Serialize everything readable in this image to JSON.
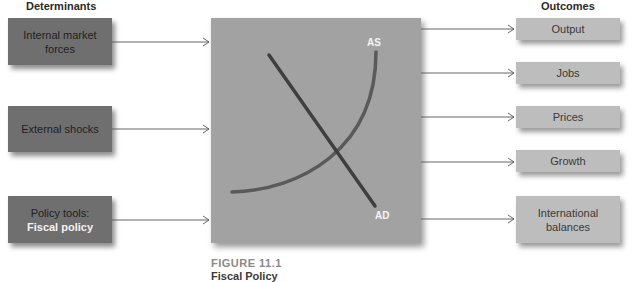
{
  "headers": {
    "determinants": "Determinants",
    "outcomes": "Outcomes"
  },
  "determinants": [
    {
      "line1": "Internal market",
      "line2": "forces"
    },
    {
      "line1": "External shocks"
    },
    {
      "line1": "Policy tools:",
      "line2": "Fiscal policy"
    }
  ],
  "outcomes": [
    {
      "line1": "Output"
    },
    {
      "line1": "Jobs"
    },
    {
      "line1": "Prices"
    },
    {
      "line1": "Growth"
    },
    {
      "line1": "International",
      "line2": "balances"
    }
  ],
  "graph": {
    "as_label": "AS",
    "ad_label": "AD"
  },
  "caption": {
    "figure": "FIGURE 11.1",
    "title": "Fiscal Policy"
  },
  "colors": {
    "determinant_box": "#6f6f6f",
    "outcome_box": "#bdbdbd",
    "center_box": "#a2a2a2",
    "ad_line": "#3f3f3f",
    "as_curve": "#5a5a5a"
  }
}
